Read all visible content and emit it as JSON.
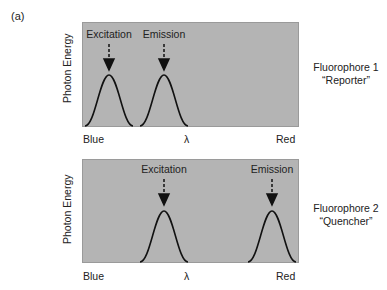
{
  "figure_label": "(a)",
  "panels": [
    {
      "name": "Fluorophore 1",
      "role": "“Reporter”",
      "ylabel": "Photon Energy",
      "x_left": "Blue",
      "x_mid": "λ",
      "x_right": "Red",
      "peaks": [
        {
          "label": "Excitation",
          "position": 0.12
        },
        {
          "label": "Emission",
          "position": 0.38
        }
      ]
    },
    {
      "name": "Fluorophore 2",
      "role": "“Quencher”",
      "ylabel": "Photon Energy",
      "x_left": "Blue",
      "x_mid": "λ",
      "x_right": "Red",
      "peaks": [
        {
          "label": "Excitation",
          "position": 0.38
        },
        {
          "label": "Emission",
          "position": 0.88
        }
      ]
    }
  ],
  "colors": {
    "panel_bg": "#b4b4b4",
    "curve": "#111111"
  }
}
